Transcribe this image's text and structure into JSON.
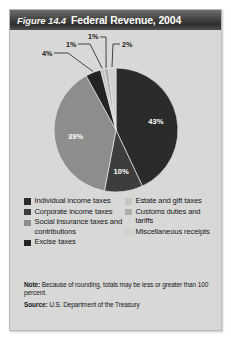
{
  "figure": {
    "number": "Figure 14.4",
    "title": "Federal Revenue, 2004"
  },
  "chart_data": {
    "type": "pie",
    "title": "Federal Revenue, 2004",
    "unit": "percent",
    "total": 100,
    "legend_position": "bottom",
    "categories": [
      "Individual income taxes",
      "Corporate income taxes",
      "Social insurance taxes and contributions",
      "Excise taxes",
      "Estate and gift taxes",
      "Customs duties and tariffs",
      "Miscellaneous receipts"
    ],
    "values": [
      43,
      10,
      39,
      4,
      1,
      1,
      2
    ],
    "labels": [
      "43%",
      "10%",
      "39%",
      "4%",
      "1%",
      "1%",
      "2%"
    ],
    "colors": [
      "#2b2b29",
      "#3d3d3b",
      "#8d8d8b",
      "#232321",
      "#c5c5c3",
      "#aeaeac",
      "#d0d0ce"
    ],
    "slices": [
      {
        "name": "Individual income taxes",
        "value": 43,
        "label": "43%",
        "color": "#2b2b29",
        "label_placement": "inside"
      },
      {
        "name": "Corporate income taxes",
        "value": 10,
        "label": "10%",
        "color": "#3d3d3b",
        "label_placement": "inside"
      },
      {
        "name": "Social insurance taxes and contributions",
        "value": 39,
        "label": "39%",
        "color": "#8d8d8b",
        "label_placement": "inside"
      },
      {
        "name": "Excise taxes",
        "value": 4,
        "label": "4%",
        "color": "#232321",
        "label_placement": "callout"
      },
      {
        "name": "Estate and gift taxes",
        "value": 1,
        "label": "1%",
        "color": "#c5c5c3",
        "label_placement": "callout"
      },
      {
        "name": "Customs duties and tariffs",
        "value": 1,
        "label": "1%",
        "color": "#aeaeac",
        "label_placement": "callout"
      },
      {
        "name": "Miscellaneous receipts",
        "value": 2,
        "label": "2%",
        "color": "#d0d0ce",
        "label_placement": "callout"
      }
    ]
  },
  "legend": {
    "left_column": [
      {
        "label": "Individual income taxes",
        "color": "#2b2b29"
      },
      {
        "label": "Corporate income taxes",
        "color": "#3d3d3b"
      },
      {
        "label": "Social insurance taxes and contributions",
        "color": "#8d8d8b"
      },
      {
        "label": "Excise taxes",
        "color": "#232321"
      }
    ],
    "right_column": [
      {
        "label": "Estate and gift taxes",
        "color": "#c5c5c3"
      },
      {
        "label": "Customs duties and tariffs",
        "color": "#aeaeac"
      },
      {
        "label": "Miscellaneous receipts",
        "color": "#d0d0ce"
      }
    ]
  },
  "footnotes": {
    "note_key": "Note:",
    "note_text": "Because of rounding, totals may be less or greater than 100 percent.",
    "source_key": "Source:",
    "source_text": "U.S. Department of the Treasury"
  }
}
